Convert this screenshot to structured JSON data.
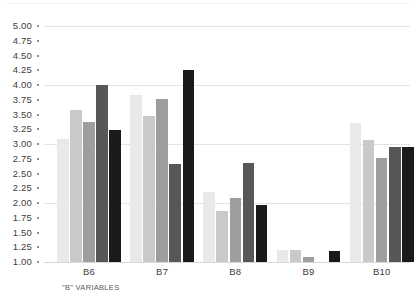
{
  "chart_data": {
    "type": "bar",
    "title": "",
    "xlabel": "\"B\" VARIABLES",
    "ylabel": "",
    "categories": [
      "B6",
      "B7",
      "B8",
      "B9",
      "B10"
    ],
    "ylim": [
      1.0,
      5.0
    ],
    "y_tick_step": 0.25,
    "y_ticks": [
      "5.00",
      "4.75",
      "4.50",
      "4.25",
      "4.00",
      "3.75",
      "3.50",
      "3.25",
      "3.00",
      "2.75",
      "2.50",
      "2.25",
      "2.00",
      "1.75",
      "1.50",
      "1.25",
      "1.00"
    ],
    "y_tick_values": [
      5.0,
      4.75,
      4.5,
      4.25,
      4.0,
      3.75,
      3.5,
      3.25,
      3.0,
      2.75,
      2.5,
      2.25,
      2.0,
      1.75,
      1.5,
      1.25,
      1.0
    ],
    "gridlines_at": [
      5.0,
      4.0,
      3.0,
      2.0,
      1.0
    ],
    "grid": true,
    "legend_position": "none",
    "series": [
      {
        "name": "Series 1",
        "color": "#e9e9e9",
        "values": [
          3.08,
          3.83,
          2.19,
          1.2,
          3.35
        ]
      },
      {
        "name": "Series 2",
        "color": "#c9c9c9",
        "values": [
          3.58,
          3.47,
          1.86,
          1.2,
          3.06
        ]
      },
      {
        "name": "Series 3",
        "color": "#9e9e9e",
        "values": [
          3.37,
          3.76,
          2.08,
          1.08,
          2.76
        ]
      },
      {
        "name": "Series 4",
        "color": "#575757",
        "values": [
          4.0,
          2.66,
          2.67,
          1.0,
          2.95
        ]
      },
      {
        "name": "Series 5",
        "color": "#1a1a1a",
        "values": [
          3.23,
          4.25,
          1.96,
          1.19,
          2.95
        ]
      }
    ]
  }
}
